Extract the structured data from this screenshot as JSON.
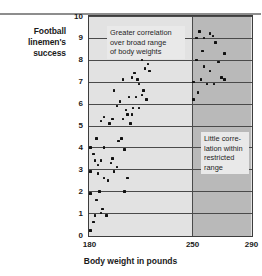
{
  "chart_data": {
    "type": "scatter",
    "title": "",
    "ylabel": "Football linemen's success",
    "xlabel": "Body weight in pounds",
    "xlim": [
      180,
      290
    ],
    "ylim": [
      0,
      10
    ],
    "xticks": [
      180,
      250,
      290
    ],
    "yticks": [
      0,
      1,
      2,
      3,
      4,
      5,
      6,
      7,
      8,
      9,
      10
    ],
    "grid": true,
    "legend": "none",
    "regions": [
      {
        "name": "broad-range",
        "x_from": 180,
        "x_to": 250,
        "shade": "#e2e2e2"
      },
      {
        "name": "restricted-range",
        "x_from": 250,
        "x_to": 290,
        "shade": "#b9b9b9"
      }
    ],
    "annotations": [
      {
        "name": "broad-range-note",
        "lines": [
          "Greater correlation",
          "over broad range",
          "of body weights"
        ]
      },
      {
        "name": "restricted-range-note",
        "lines": [
          "Little corre-",
          "lation within",
          "restricted",
          "range"
        ]
      }
    ],
    "points": [
      [
        181,
        0.2
      ],
      [
        183,
        0.6
      ],
      [
        184,
        0.9
      ],
      [
        188,
        1.0
      ],
      [
        189,
        1.2
      ],
      [
        192,
        0.9
      ],
      [
        181,
        1.9
      ],
      [
        185,
        1.6
      ],
      [
        187,
        2.0
      ],
      [
        204,
        2.0
      ],
      [
        181,
        2.9
      ],
      [
        186,
        2.8
      ],
      [
        190,
        2.6
      ],
      [
        193,
        2.5
      ],
      [
        197,
        2.9
      ],
      [
        206,
        2.6
      ],
      [
        183,
        3.7
      ],
      [
        184,
        3.4
      ],
      [
        186,
        3.2
      ],
      [
        188,
        3.4
      ],
      [
        195,
        3.3
      ],
      [
        199,
        3.1
      ],
      [
        181,
        4.0
      ],
      [
        185,
        4.4
      ],
      [
        190,
        4.0
      ],
      [
        196,
        3.5
      ],
      [
        200,
        4.3
      ],
      [
        202,
        4.4
      ],
      [
        204,
        3.9
      ],
      [
        188,
        5.2
      ],
      [
        190,
        5.4
      ],
      [
        194,
        5.1
      ],
      [
        196,
        5.3
      ],
      [
        203,
        5.3
      ],
      [
        206,
        5.5
      ],
      [
        208,
        5.1
      ],
      [
        209,
        5.5
      ],
      [
        199,
        5.9
      ],
      [
        201,
        6.1
      ],
      [
        205,
        5.7
      ],
      [
        210,
        5.8
      ],
      [
        212,
        6.3
      ],
      [
        214,
        5.8
      ],
      [
        216,
        6.4
      ],
      [
        197,
        6.6
      ],
      [
        207,
        6.3
      ],
      [
        217,
        6.6
      ],
      [
        219,
        6.2
      ],
      [
        203,
        7.1
      ],
      [
        209,
        7.2
      ],
      [
        211,
        7.4
      ],
      [
        213,
        7.1
      ],
      [
        214,
        6.9
      ],
      [
        218,
        7.6
      ],
      [
        220,
        7.8
      ],
      [
        216,
        8.0
      ],
      [
        219,
        8.1
      ],
      [
        221,
        7.5
      ],
      [
        253,
        9.0
      ],
      [
        255,
        9.3
      ],
      [
        257,
        8.4
      ],
      [
        258,
        9.0
      ],
      [
        262,
        9.2
      ],
      [
        264,
        9.1
      ],
      [
        266,
        8.8
      ],
      [
        253,
        8.0
      ],
      [
        258,
        7.7
      ],
      [
        262,
        7.5
      ],
      [
        268,
        7.9
      ],
      [
        272,
        8.3
      ],
      [
        251,
        7.0
      ],
      [
        256,
        7.1
      ],
      [
        260,
        6.9
      ],
      [
        265,
        6.9
      ],
      [
        270,
        7.2
      ],
      [
        272,
        7.1
      ],
      [
        251,
        6.2
      ],
      [
        254,
        6.5
      ]
    ]
  },
  "axes": {
    "y_title": "Football linemen's\nsuccess",
    "y_title_line1": "Football linemen's",
    "y_title_line2": "success",
    "x_title": "Body weight in pounds"
  }
}
